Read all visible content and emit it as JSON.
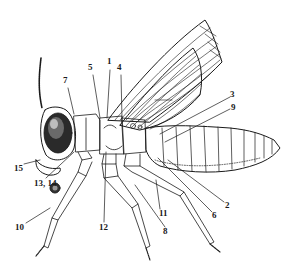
{
  "diagram": {
    "ink_color": "#1a1a1a",
    "background": "#ffffff",
    "labels": [
      {
        "id": "1",
        "text": "1",
        "x": 107,
        "y": 61
      },
      {
        "id": "2",
        "text": "2",
        "x": 225,
        "y": 204
      },
      {
        "id": "3",
        "text": "3",
        "x": 230,
        "y": 93
      },
      {
        "id": "4",
        "text": "4",
        "x": 118,
        "y": 66
      },
      {
        "id": "5",
        "text": "5",
        "x": 89,
        "y": 66
      },
      {
        "id": "6",
        "text": "6",
        "x": 212,
        "y": 214
      },
      {
        "id": "7",
        "text": "7",
        "x": 64,
        "y": 79
      },
      {
        "id": "8",
        "text": "8",
        "x": 164,
        "y": 229
      },
      {
        "id": "9",
        "text": "9",
        "x": 231,
        "y": 105
      },
      {
        "id": "10",
        "text": "10",
        "x": 15,
        "y": 225
      },
      {
        "id": "11",
        "text": "11",
        "x": 160,
        "y": 211
      },
      {
        "id": "12",
        "text": "12",
        "x": 99,
        "y": 225
      },
      {
        "id": "13_14",
        "text": "13, 14",
        "x": 34,
        "y": 181
      },
      {
        "id": "15",
        "text": "15",
        "x": 15,
        "y": 166
      }
    ]
  }
}
